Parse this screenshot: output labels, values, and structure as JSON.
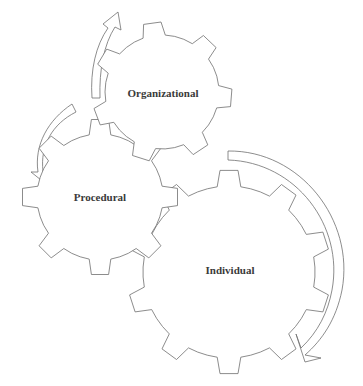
{
  "diagram": {
    "type": "interlocking-gears",
    "gears": [
      {
        "id": "organizational",
        "label": "Organizational",
        "cx": 162,
        "cy": 92,
        "r_outer": 70,
        "r_inner": 57,
        "teeth": 7,
        "rotation": -8
      },
      {
        "id": "procedural",
        "label": "Procedural",
        "cx": 100,
        "cy": 197,
        "r_outer": 78,
        "r_inner": 63,
        "teeth": 8,
        "rotation": 0
      },
      {
        "id": "individual",
        "label": "Individual",
        "cx": 229,
        "cy": 272,
        "r_outer": 102,
        "r_inner": 86,
        "teeth": 10,
        "rotation": 0
      }
    ],
    "arrows": [
      {
        "id": "arrow-to-organizational",
        "direction": "up",
        "from": "procedural",
        "to": "organizational"
      },
      {
        "id": "arrow-to-procedural",
        "direction": "down-left",
        "from": "organizational",
        "to": "procedural"
      },
      {
        "id": "arrow-to-individual",
        "direction": "down",
        "from": "organizational",
        "to": "individual"
      }
    ],
    "colors": {
      "stroke": "#6e6e6e",
      "text": "#3a3a3a",
      "background": "#ffffff"
    }
  },
  "caption": {
    "text": "... (cropped caption text at bottom edge)"
  }
}
